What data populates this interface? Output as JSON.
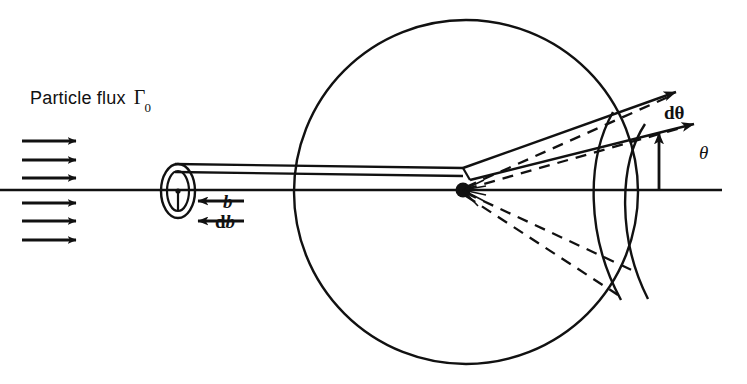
{
  "figure": {
    "kind": "scattering-cross-section-diagram",
    "background_color": "#ffffff",
    "ink_color": "#111111",
    "width": 747,
    "height": 384
  },
  "labels": {
    "flux_text": "Particle flux",
    "flux_symbol": "Γ",
    "flux_subscript": "0",
    "impact_parameter": "b",
    "impact_parameter_differential_prefix": "d",
    "impact_parameter_differential_symbol": "b",
    "solid_angle_element": "dθ",
    "scattering_angle": "θ"
  },
  "geometry": {
    "axis": {
      "name": "beam-axis",
      "y": 190,
      "x_start": 0,
      "x_end": 722
    },
    "sphere": {
      "name": "detector-sphere",
      "cx": 466,
      "cy": 192,
      "r": 172
    },
    "scattering_center": {
      "cx": 463,
      "cy": 190,
      "r": 7
    },
    "impact_ring": {
      "cx": 178,
      "cy": 191,
      "rx_outer": 17,
      "ry_outer": 27,
      "rx_inner": 11,
      "ry_inner": 20
    },
    "flux_arrows": {
      "count": 6,
      "x_start": 22,
      "x_end": 82,
      "y_values": [
        141,
        160,
        178,
        203,
        221,
        240
      ]
    },
    "b_arrows": [
      {
        "name": "b-arrow",
        "x_start": 244,
        "x_end": 196,
        "y": 201
      },
      {
        "name": "db-arrow",
        "x_start": 244,
        "x_end": 196,
        "y": 221
      }
    ],
    "cone_angle_deg_upper_outer": 29,
    "cone_angle_deg_upper_inner": 21,
    "cone_angle_deg_lower_inner": 21,
    "cone_angle_deg_lower_outer": 35,
    "theta_arrow": {
      "x": 659,
      "y_tail": 189,
      "y_head": 131
    }
  }
}
